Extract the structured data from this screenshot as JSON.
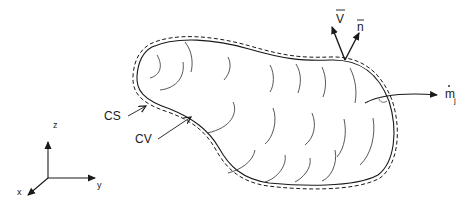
{
  "diagram": {
    "type": "control-volume",
    "labels": {
      "control_surface": "CS",
      "control_volume": "CV",
      "velocity": "V",
      "normal": "n",
      "mass_flow": "m",
      "mass_flow_subscript": "j"
    },
    "axes": {
      "x": "x",
      "y": "y",
      "z": "z"
    },
    "colors": {
      "stroke": "#1a1a1a",
      "hatch": "#444444",
      "background": "#ffffff"
    }
  }
}
